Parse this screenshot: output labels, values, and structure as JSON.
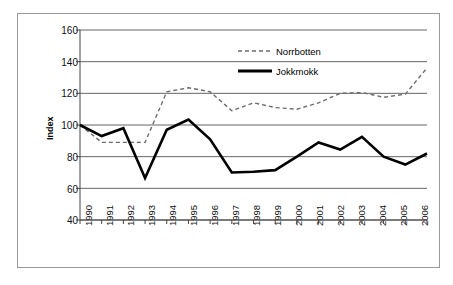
{
  "chart_data": {
    "type": "line",
    "title": "",
    "xlabel": "",
    "ylabel": "Index",
    "x": [
      1990,
      1991,
      1992,
      1993,
      1994,
      1995,
      1996,
      1997,
      1998,
      1999,
      2000,
      2001,
      2002,
      2003,
      2004,
      2005,
      2006
    ],
    "xtick_labels": [
      "1990",
      "1991",
      "1992",
      "1993",
      "1994",
      "1995",
      "1996",
      "1997",
      "1998",
      "1999",
      "2000",
      "2001",
      "2002",
      "2003",
      "2004",
      "2005",
      "2006"
    ],
    "ytick_labels": [
      "160",
      "140",
      "120",
      "100",
      "80",
      "60",
      "40"
    ],
    "ylim": [
      40,
      160
    ],
    "ytick_values": [
      160,
      140,
      120,
      100,
      80,
      60,
      40
    ],
    "grid": "horizontal",
    "legend_position": "top-center",
    "series": [
      {
        "name": "Norrbotten",
        "style": "dashed",
        "color": "#6b6b6b",
        "values": [
          100,
          89,
          89,
          89,
          121,
          123.5,
          121,
          109,
          114,
          111,
          110,
          114,
          120,
          120.5,
          117.5,
          119.5,
          136
        ]
      },
      {
        "name": "Jokkmokk",
        "style": "solid",
        "color": "#000000",
        "values": [
          100,
          93,
          98,
          66.5,
          97,
          103.5,
          91,
          70,
          70.5,
          71.5,
          80,
          89,
          84.5,
          92.5,
          80,
          75,
          82
        ]
      }
    ]
  },
  "legend": {
    "entries": [
      {
        "label": "Norrbotten"
      },
      {
        "label": "Jokkmokk"
      }
    ]
  },
  "axes": {
    "y_axis_title": "Index"
  }
}
